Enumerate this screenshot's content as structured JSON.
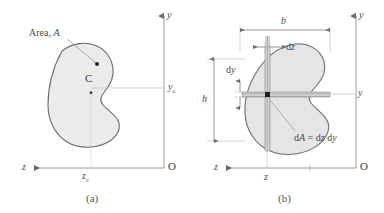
{
  "figure": {
    "type": "engineering-diagram",
    "background_color": "#ffffff",
    "line_color": "#8a8a8a",
    "shape_fill": "#eceaea",
    "shape_stroke": "#6d6d6d",
    "text_color": "#4a4a4a"
  },
  "panel_a": {
    "caption": "(a)",
    "area_label": "Area,",
    "area_symbol": "A",
    "centroid_label": "C",
    "axis_y_label": "y",
    "axis_z_label": "z",
    "origin_label": "O",
    "dim_yc_label": "y",
    "dim_yc_sub": "c",
    "dim_zc_label": "z",
    "dim_zc_sub": "c"
  },
  "panel_b": {
    "caption": "(b)",
    "axis_y_label": "y",
    "axis_z_label": "z",
    "origin_label": "O",
    "dim_b_label": "b",
    "dim_h_label": "h",
    "dim_dz_label": "d",
    "dim_dz_var": "z",
    "dim_dy_label": "d",
    "dim_dy_var": "y",
    "coord_z_label": "z",
    "coord_y_label": "y",
    "element_eq_d1": "d",
    "element_eq_A": "A",
    "element_eq_mid": " = d",
    "element_eq_z": "z",
    "element_eq_d2": " d",
    "element_eq_y": "y",
    "element_equation": "dA = dz dy"
  }
}
